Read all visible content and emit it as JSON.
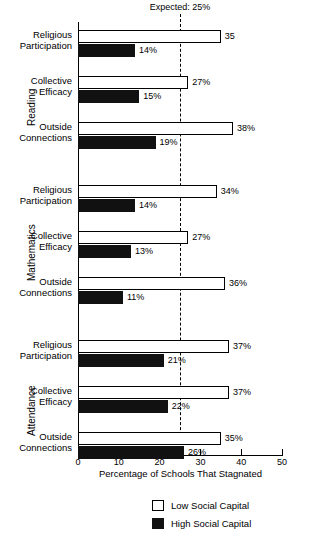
{
  "chart_data": {
    "type": "bar",
    "orientation": "horizontal",
    "title": "",
    "xlabel": "Percentage of Schools That Stagnated",
    "ylabel": "",
    "xlim": [
      0,
      50
    ],
    "xticks": [
      0,
      10,
      20,
      30,
      40,
      50
    ],
    "xtick_labels": [
      "0",
      "10",
      "20",
      "30",
      "40",
      "50"
    ],
    "grid": false,
    "legend_position": "bottom",
    "reference_line": {
      "label": "Expected: 25%",
      "value": 25
    },
    "series": [
      {
        "name": "Low Social Capital",
        "color": "#ffffff"
      },
      {
        "name": "High Social Capital",
        "color": "#111111"
      }
    ],
    "groups": [
      {
        "name": "Reading",
        "categories": [
          {
            "label_line1": "Religious",
            "label_line2": "Participation",
            "low": 35,
            "low_label": "35",
            "high": 14,
            "high_label": "14%"
          },
          {
            "label_line1": "Collective",
            "label_line2": "Efficacy",
            "low": 27,
            "low_label": "27%",
            "high": 15,
            "high_label": "15%"
          },
          {
            "label_line1": "Outside",
            "label_line2": "Connections",
            "low": 38,
            "low_label": "38%",
            "high": 19,
            "high_label": "19%"
          }
        ]
      },
      {
        "name": "Mathematics",
        "categories": [
          {
            "label_line1": "Religious",
            "label_line2": "Participation",
            "low": 34,
            "low_label": "34%",
            "high": 14,
            "high_label": "14%"
          },
          {
            "label_line1": "Collective",
            "label_line2": "Efficacy",
            "low": 27,
            "low_label": "27%",
            "high": 13,
            "high_label": "13%"
          },
          {
            "label_line1": "Outside",
            "label_line2": "Connections",
            "low": 36,
            "low_label": "36%",
            "high": 11,
            "high_label": "11%"
          }
        ]
      },
      {
        "name": "Attendance",
        "categories": [
          {
            "label_line1": "Religious",
            "label_line2": "Participation",
            "low": 37,
            "low_label": "37%",
            "high": 21,
            "high_label": "21%"
          },
          {
            "label_line1": "Collective",
            "label_line2": "Efficacy",
            "low": 37,
            "low_label": "37%",
            "high": 22,
            "high_label": "22%"
          },
          {
            "label_line1": "Outside",
            "label_line2": "Connections",
            "low": 35,
            "low_label": "35%",
            "high": 26,
            "high_label": "26%"
          }
        ]
      }
    ]
  },
  "legend": {
    "items": [
      {
        "label": "Low Social Capital",
        "style": "low"
      },
      {
        "label": "High Social Capital",
        "style": "high"
      }
    ]
  }
}
